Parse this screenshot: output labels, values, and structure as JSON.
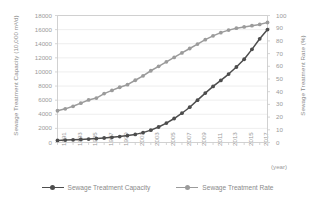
{
  "axes": {
    "left_title": "Sewage Treatment Capacity (10,000 m³/d)",
    "right_title": "Sewage Treatment Rate (%)",
    "x_unit": "(year)",
    "left_ticks": [
      "0",
      "2000",
      "4000",
      "6000",
      "8000",
      "10000",
      "12000",
      "14000",
      "16000",
      "18000"
    ],
    "right_ticks": [
      "0",
      "10",
      "20",
      "30",
      "40",
      "50",
      "60",
      "70",
      "80",
      "90",
      "100"
    ],
    "x_ticks": [
      "1991",
      "1993",
      "1995",
      "1997",
      "1999",
      "2001",
      "2003",
      "2005",
      "2007",
      "2009",
      "2011",
      "2013",
      "2015",
      "2017"
    ]
  },
  "legend": {
    "items": [
      {
        "label": "Sewage Treatment Capacity",
        "color": "#4d4d4d"
      },
      {
        "label": "Sewage Treatment Rate",
        "color": "#9b9b9b"
      }
    ]
  },
  "colors": {
    "capacity": "#4d4d4d",
    "rate": "#9b9b9b",
    "grid": "#e6e6e6",
    "frame": "#cccccc",
    "text": "#9a9a9a"
  },
  "chart_data": {
    "type": "line",
    "title": "",
    "subtitle": "",
    "xlabel": "(year)",
    "ylabel": "Sewage Treatment Capacity (10,000 m³/d)",
    "y2label": "Sewage Treatment Rate (%)",
    "ylim": [
      0,
      18000
    ],
    "y2lim": [
      0,
      100
    ],
    "grid": true,
    "legend_position": "bottom",
    "x": [
      1991,
      1992,
      1993,
      1994,
      1995,
      1996,
      1997,
      1998,
      1999,
      2000,
      2001,
      2002,
      2003,
      2004,
      2005,
      2006,
      2007,
      2008,
      2009,
      2010,
      2011,
      2012,
      2013,
      2014,
      2015,
      2016,
      2017,
      2018
    ],
    "series": [
      {
        "name": "Sewage Treatment Capacity",
        "axis": "left",
        "unit": "10,000 m³/d",
        "values": [
          300,
          340,
          380,
          430,
          490,
          560,
          640,
          730,
          840,
          980,
          1150,
          1400,
          1750,
          2200,
          2750,
          3400,
          4150,
          5000,
          6000,
          7000,
          7950,
          8800,
          9700,
          10700,
          11800,
          13200,
          14700,
          16000
        ]
      },
      {
        "name": "Sewage Treatment Rate",
        "axis": "right",
        "unit": "%",
        "values": [
          25.0,
          26.5,
          28.5,
          31.0,
          33.5,
          35.0,
          38.5,
          41.0,
          43.5,
          45.5,
          49.0,
          52.5,
          56.5,
          60.0,
          63.5,
          67.0,
          70.5,
          74.0,
          77.5,
          81.0,
          84.0,
          86.5,
          88.5,
          90.0,
          91.0,
          92.0,
          93.0,
          94.5
        ]
      }
    ]
  }
}
